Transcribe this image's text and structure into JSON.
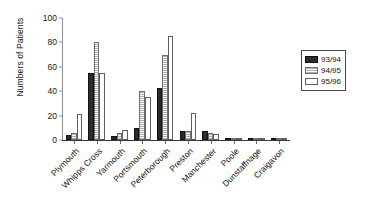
{
  "chart_data": {
    "type": "bar",
    "title": "",
    "xlabel": "",
    "ylabel": "Numbers of Patients",
    "ylim": [
      0,
      100
    ],
    "yticks": [
      0,
      20,
      40,
      60,
      80,
      100
    ],
    "grid": false,
    "legend_position": "right",
    "categories": [
      "Plymouth",
      "Whipps Cross",
      "Yarmouth",
      "Portsmouth",
      "Peterborough",
      "Preston",
      "Manchester",
      "Poole",
      "Dunstaffnage",
      "Craigavon"
    ],
    "series": [
      {
        "name": "93/94",
        "fill": "solid-dark",
        "color": "#2b2b2b",
        "values": [
          4,
          55,
          3,
          10,
          43,
          7,
          7,
          1,
          1,
          1
        ]
      },
      {
        "name": "94/95",
        "fill": "speckled-light",
        "color": "#e9e9e9",
        "values": [
          6,
          80,
          6,
          40,
          70,
          7,
          6,
          1,
          1,
          1
        ]
      },
      {
        "name": "95/96",
        "fill": "white",
        "color": "#ffffff",
        "values": [
          21,
          55,
          8,
          35,
          85,
          22,
          5,
          1,
          1,
          1
        ]
      }
    ]
  },
  "axes": {
    "y_label": "Numbers of Patients",
    "y_tick_labels": [
      "0",
      "20",
      "40",
      "60",
      "80",
      "100"
    ]
  },
  "legend": {
    "entries": [
      {
        "label": "93/94"
      },
      {
        "label": "94/95"
      },
      {
        "label": "95/96"
      }
    ]
  }
}
